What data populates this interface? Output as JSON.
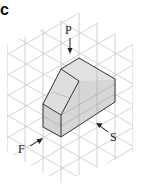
{
  "panel_label": "c",
  "labels": {
    "top": "P",
    "front": "F",
    "side": "S"
  },
  "colors": {
    "grid": "#c8c8c8",
    "outline": "#333333",
    "face_fill": "#d9d9d9",
    "top_fill": "#e4e4e4"
  }
}
